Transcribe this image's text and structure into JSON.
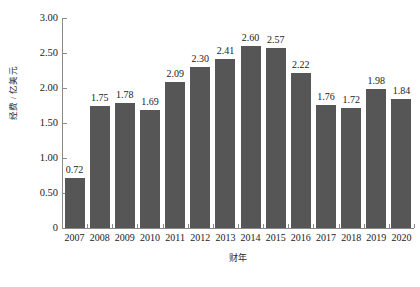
{
  "chart_data": {
    "type": "bar",
    "title": "",
    "subtitle": "",
    "xlabel": "财年",
    "ylabel": "经费 / 亿美元",
    "categories": [
      "2007",
      "2008",
      "2009",
      "2010",
      "2011",
      "2012",
      "2013",
      "2014",
      "2015",
      "2016",
      "2017",
      "2018",
      "2019",
      "2020"
    ],
    "values": [
      0.72,
      1.75,
      1.78,
      1.69,
      2.09,
      2.3,
      2.41,
      2.6,
      2.57,
      2.22,
      1.76,
      1.72,
      1.98,
      1.84
    ],
    "value_labels": [
      "0.72",
      "1.75",
      "1.78",
      "1.69",
      "2.09",
      "2.30",
      "2.41",
      "2.60",
      "2.57",
      "2.22",
      "1.76",
      "1.72",
      "1.98",
      "1.84"
    ],
    "ylim": [
      0,
      3.0
    ],
    "yticks": [
      0,
      0.5,
      1.0,
      1.5,
      2.0,
      2.5,
      3.0
    ],
    "ytick_labels": [
      "0",
      "0.50",
      "1.00",
      "1.50",
      "2.00",
      "2.50",
      "3.00"
    ],
    "grid": false,
    "legend": null,
    "legend_position": "none",
    "bar_color": "#565656",
    "axis_color": "#8a8a8a",
    "text_color": "#1a1a1a",
    "background": "#ffffff"
  }
}
